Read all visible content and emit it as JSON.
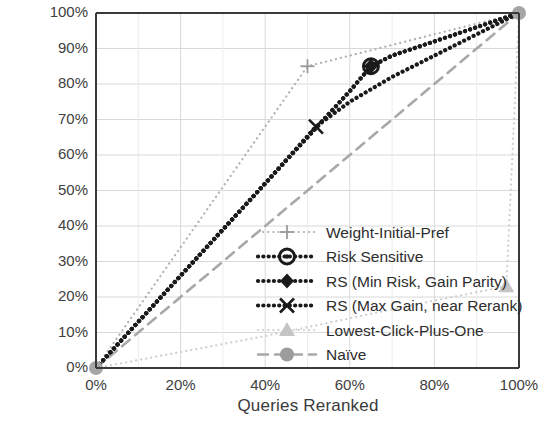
{
  "chart_data": {
    "type": "line",
    "title": "",
    "xlabel": "Queries Reranked",
    "ylabel": "Normalized Gain",
    "xlim": [
      0,
      100
    ],
    "ylim": [
      0,
      100
    ],
    "xticks": [
      "0%",
      "20%",
      "40%",
      "60%",
      "80%",
      "100%"
    ],
    "xtick_values": [
      0,
      20,
      40,
      60,
      80,
      100
    ],
    "yticks": [
      "0%",
      "10%",
      "20%",
      "30%",
      "40%",
      "50%",
      "60%",
      "70%",
      "80%",
      "90%",
      "100%"
    ],
    "ytick_values": [
      0,
      10,
      20,
      30,
      40,
      50,
      60,
      70,
      80,
      90,
      100
    ],
    "grid": true,
    "grid_color": "#d9d9d9",
    "legend_position": "lower-right-inside",
    "series": [
      {
        "name": "Weight-Initial-Pref",
        "style": "dotted",
        "color": "#b0b0b0",
        "marker": "plus",
        "marker_color": "#9a9a9a",
        "x": [
          0,
          10,
          20,
          30,
          40,
          50,
          60,
          70,
          80,
          90,
          100
        ],
        "y": [
          0,
          17,
          34,
          51,
          68,
          85,
          88,
          91,
          94,
          97,
          100
        ],
        "marker_points": [
          [
            0,
            0
          ],
          [
            50,
            85
          ],
          [
            100,
            100
          ]
        ]
      },
      {
        "name": "Risk Sensitive",
        "style": "dotted-thick",
        "color": "#1a1a1a",
        "marker": "circle-dot",
        "marker_color": "#1a1a1a",
        "x": [
          0,
          10,
          20,
          30,
          40,
          50,
          60,
          65,
          70,
          80,
          90,
          100
        ],
        "y": [
          0,
          13,
          26,
          39,
          52,
          65,
          78,
          85,
          88,
          92,
          96,
          100
        ],
        "marker_points": [
          [
            0,
            0
          ],
          [
            65,
            85
          ],
          [
            100,
            100
          ]
        ]
      },
      {
        "name": "RS (Min Risk, Gain Parity)",
        "style": "dotted-thick",
        "color": "#1a1a1a",
        "marker": "diamond",
        "marker_color": "#1a1a1a",
        "x": [
          0,
          10,
          20,
          30,
          40,
          50,
          60,
          65,
          70,
          80,
          90,
          100
        ],
        "y": [
          0,
          13,
          26,
          39,
          52,
          65,
          78,
          85,
          88,
          92,
          96,
          100
        ],
        "marker_points": [
          [
            0,
            0
          ],
          [
            65,
            85
          ],
          [
            100,
            100
          ]
        ]
      },
      {
        "name": "RS (Max Gain, near Rerank)",
        "style": "dotted-thick",
        "color": "#1a1a1a",
        "marker": "x-cross",
        "marker_color": "#1a1a1a",
        "x": [
          0,
          10,
          20,
          30,
          40,
          52,
          60,
          70,
          80,
          90,
          100
        ],
        "y": [
          0,
          13,
          26,
          39,
          52,
          68,
          75,
          82,
          88,
          94,
          100
        ],
        "marker_points": [
          [
            0,
            0
          ],
          [
            52,
            68
          ],
          [
            100,
            100
          ]
        ]
      },
      {
        "name": "Lowest-Click-Plus-One",
        "style": "dotted",
        "color": "#cfcfcf",
        "marker": "triangle",
        "marker_color": "#c4c4c4",
        "x": [
          0,
          20,
          40,
          60,
          80,
          97,
          100
        ],
        "y": [
          0,
          4.5,
          9,
          14,
          19,
          23,
          100
        ],
        "marker_points": [
          [
            0,
            0
          ],
          [
            97,
            23
          ],
          [
            100,
            100
          ]
        ]
      },
      {
        "name": "Naïve",
        "style": "dashed",
        "color": "#a8a8a8",
        "marker": "circle",
        "marker_color": "#9c9c9c",
        "x": [
          0,
          20,
          40,
          60,
          80,
          100
        ],
        "y": [
          0,
          20,
          40,
          60,
          80,
          100
        ],
        "marker_points": [
          [
            0,
            0
          ],
          [
            100,
            100
          ]
        ]
      }
    ]
  },
  "legend": {
    "items": [
      {
        "label": "Weight-Initial-Pref"
      },
      {
        "label": "Risk Sensitive"
      },
      {
        "label": "RS (Min Risk, Gain Parity)"
      },
      {
        "label": "RS (Max Gain, near Rerank)"
      },
      {
        "label": "Lowest-Click-Plus-One"
      },
      {
        "label": "Naïve"
      }
    ]
  }
}
